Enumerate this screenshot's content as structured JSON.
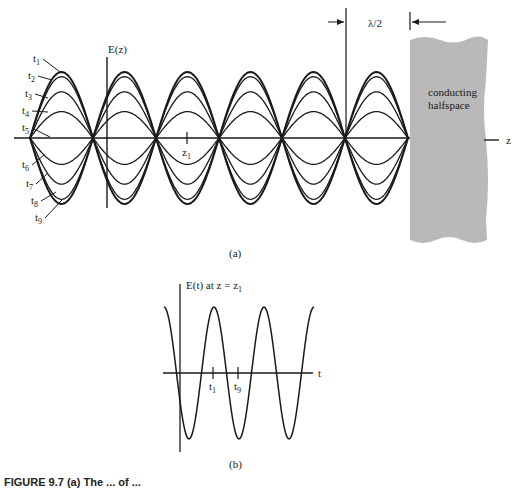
{
  "figure": {
    "panel_a": {
      "label": "(a)",
      "y_axis_label": "E(z)",
      "x_axis_label": "z",
      "position_marker": "z",
      "position_marker_sub": "1",
      "wavelength_marker": "λ/2",
      "region_label_line1": "conducting",
      "region_label_line2": "halfspace",
      "time_labels": [
        {
          "t": "t",
          "sub": "1"
        },
        {
          "t": "t",
          "sub": "2"
        },
        {
          "t": "t",
          "sub": "3"
        },
        {
          "t": "t",
          "sub": "4"
        },
        {
          "t": "t",
          "sub": "5"
        },
        {
          "t": "t",
          "sub": "6"
        },
        {
          "t": "t",
          "sub": "7"
        },
        {
          "t": "t",
          "sub": "8"
        },
        {
          "t": "t",
          "sub": "9"
        }
      ],
      "region_color": "#b9b9b9"
    },
    "panel_b": {
      "label": "(b)",
      "y_axis_label": "E(t) at z = z",
      "y_axis_label_sub": "1",
      "x_axis_label": "t",
      "ticks": [
        {
          "t": "t",
          "sub": "1"
        },
        {
          "t": "t",
          "sub": "9"
        }
      ]
    },
    "caption": "FIGURE 9.7  (a) The ... of ..."
  },
  "chart_data": [
    {
      "type": "line",
      "title": "(a) Standing wave E(z) at successive times t1…t9 in front of a conducting halfspace",
      "xlabel": "z",
      "ylabel": "E(z)",
      "nodes_count": 7,
      "node_spacing": "λ/2",
      "series": [
        {
          "name": "t1",
          "relative_amplitude": 1.0
        },
        {
          "name": "t2",
          "relative_amplitude": 0.93
        },
        {
          "name": "t3",
          "relative_amplitude": 0.7
        },
        {
          "name": "t4",
          "relative_amplitude": 0.4
        },
        {
          "name": "t5",
          "relative_amplitude": 0.0
        },
        {
          "name": "t6",
          "relative_amplitude": -0.4
        },
        {
          "name": "t7",
          "relative_amplitude": -0.7
        },
        {
          "name": "t8",
          "relative_amplitude": -0.93
        },
        {
          "name": "t9",
          "relative_amplitude": -1.0
        }
      ],
      "annotations": [
        "z1",
        "λ/2",
        "conducting halfspace"
      ]
    },
    {
      "type": "line",
      "title": "(b) E(t) at z = z1",
      "xlabel": "t",
      "ylabel": "E(t) at z = z1",
      "shape": "sinusoid, ~3 periods",
      "ticks": [
        "t1",
        "t9"
      ]
    }
  ]
}
